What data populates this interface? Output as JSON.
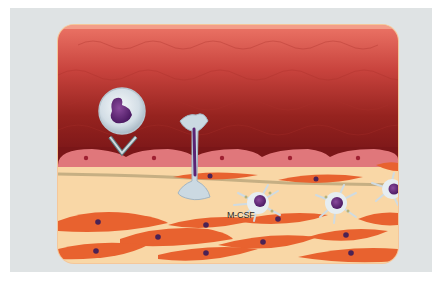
{
  "figure": {
    "labels": {
      "mcsf": "M-CSF"
    },
    "layers": [
      {
        "name": "vessel-lumen",
        "color": "#b33a36"
      },
      {
        "name": "endothelium",
        "color": "#e0777b",
        "cell_count": 5
      },
      {
        "name": "subendothelial-space",
        "color": "#f9d7a6"
      },
      {
        "name": "smooth-muscle-layer",
        "color": "#e8622f"
      }
    ],
    "cells": [
      {
        "type": "monocyte-rolling",
        "color": "#d9e3ea",
        "nucleus_color": "#6a2a7a"
      },
      {
        "type": "monocyte-transmigrating",
        "color": "#c9d8e2",
        "nucleus_color": "#5a2373"
      },
      {
        "type": "macrophage",
        "count": 3,
        "color": "#dfe7ec",
        "nucleus_color": "#6b2d83"
      },
      {
        "type": "smooth-muscle-cell",
        "color": "#e8622f",
        "nucleus_color": "#4a2255"
      }
    ],
    "colors": {
      "background": "#dfe3e4",
      "lumen_top": "#e86c60",
      "lumen_bottom": "#8a1c1c",
      "fiber": "#b9a57a"
    }
  }
}
